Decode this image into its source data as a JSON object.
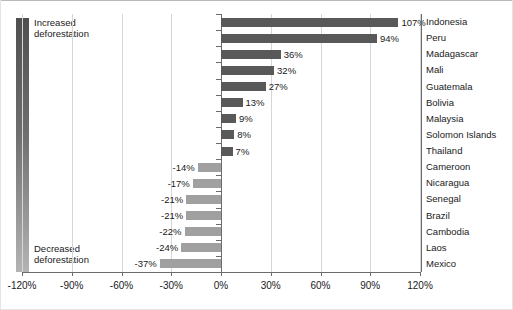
{
  "chart_data": {
    "type": "bar",
    "orientation": "horizontal",
    "title": "",
    "subtitle": "",
    "xlabel": "",
    "ylabel": "",
    "xlim": [
      -120,
      120
    ],
    "xticks": [
      "-120%",
      "-90%",
      "-60%",
      "-30%",
      "0%",
      "30%",
      "60%",
      "90%",
      "120%"
    ],
    "xtick_values": [
      -120,
      -90,
      -60,
      -30,
      0,
      30,
      60,
      90,
      120
    ],
    "grid": true,
    "grid_axis": "x",
    "legend_position": "left",
    "categories": [
      "Indonesia",
      "Peru",
      "Madagascar",
      "Mali",
      "Guatemala",
      "Bolivia",
      "Malaysia",
      "Solomon Islands",
      "Thailand",
      "Cameroon",
      "Nicaragua",
      "Senegal",
      "Brazil",
      "Cambodia",
      "Laos",
      "Mexico"
    ],
    "values": [
      107,
      94,
      36,
      32,
      27,
      13,
      9,
      8,
      7,
      -14,
      -17,
      -21,
      -21,
      -22,
      -24,
      -37
    ],
    "data_labels": [
      "107%",
      "94%",
      "36%",
      "32%",
      "27%",
      "13%",
      "9%",
      "8%",
      "7%",
      "-14%",
      "-17%",
      "-21%",
      "-21%",
      "-22%",
      "-24%",
      "-37%"
    ],
    "series": [
      {
        "name": "Change in deforestation",
        "values": [
          107,
          94,
          36,
          32,
          27,
          13,
          9,
          8,
          7,
          -14,
          -17,
          -21,
          -21,
          -22,
          -24,
          -37
        ]
      }
    ],
    "colors": {
      "positive_bar": "#595959",
      "negative_bar": "#a0a0a0",
      "gridline": "#d6d6d6",
      "axis": "#6b6b6b",
      "text": "#1a1a1a"
    }
  },
  "legend": {
    "top_label": "Increased\ndeforestation",
    "bottom_label": "Decreased\ndeforestation",
    "gradient_top_color": "#4f4f4f",
    "gradient_bottom_color": "#b3b3b3"
  }
}
